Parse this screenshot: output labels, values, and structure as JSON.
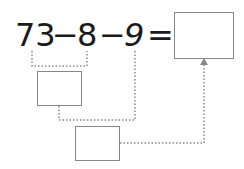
{
  "equation": {
    "tokens": [
      "73",
      "−",
      "8",
      "−",
      "9",
      "="
    ],
    "first_number": "73",
    "operator_1": "−",
    "second_number": "8",
    "operator_2": "−",
    "third_number": "9",
    "equals": "="
  },
  "answer_boxes": {
    "step_1": "",
    "step_2": "",
    "result": ""
  },
  "colors": {
    "text": "#1a1a1a",
    "box_border": "#888888",
    "dotted_line": "#888888"
  }
}
